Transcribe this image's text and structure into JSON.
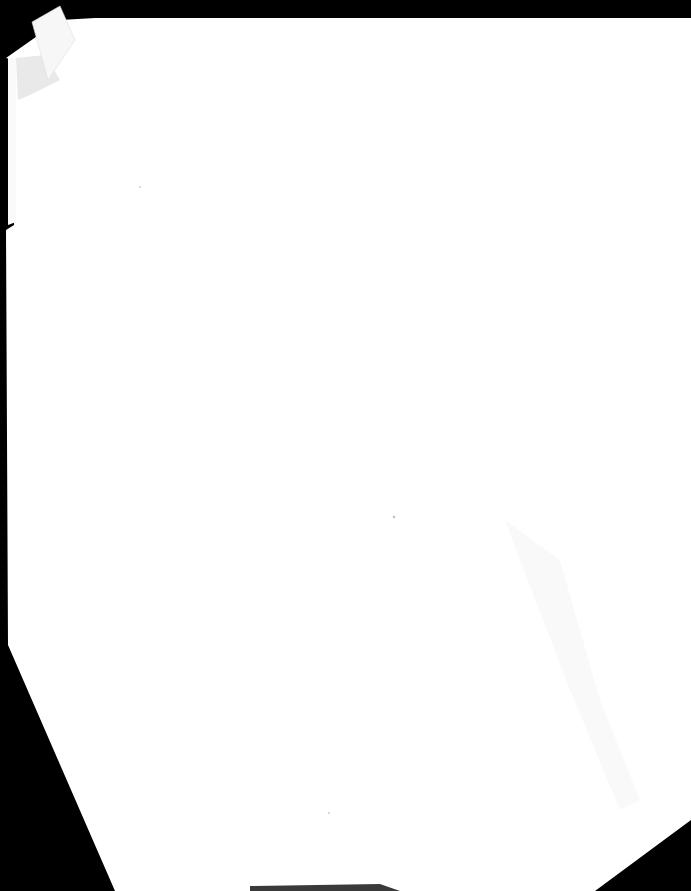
{
  "document": {
    "type": "scanned-page",
    "text_content": "",
    "colors": {
      "background": "#000000",
      "paper": "#ffffff",
      "shadow": "#ececec",
      "tab": "#f7f7f7"
    }
  }
}
